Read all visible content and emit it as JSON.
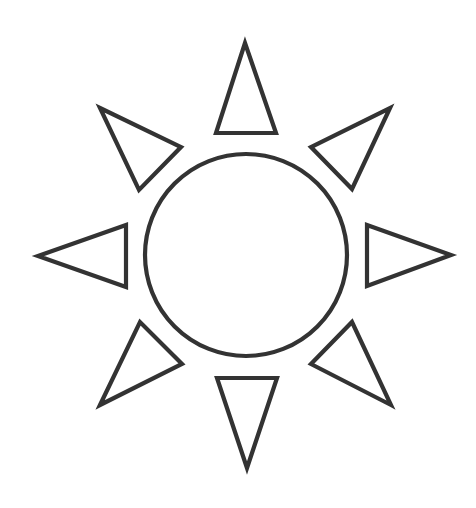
{
  "image": {
    "width": 476,
    "height": 508,
    "background": "#ffffff",
    "description": "Sun outline icon"
  },
  "sun": {
    "stroke_color": "#333333",
    "fill_color": "#ffffff",
    "core": {
      "cx": 246,
      "cy": 255,
      "r": 101
    },
    "rays": [
      {
        "name": "ray-top",
        "points": "245,43 276,133 216,133"
      },
      {
        "name": "ray-top-right",
        "points": "390,108 352,189 311,147"
      },
      {
        "name": "ray-right",
        "points": "451,255 367,286 367,225"
      },
      {
        "name": "ray-bottom-right",
        "points": "391,405 311,364 352,322"
      },
      {
        "name": "ray-bottom",
        "points": "247,468 217,378 277,378"
      },
      {
        "name": "ray-bottom-left",
        "points": "100,405 140,322 182,364"
      },
      {
        "name": "ray-left",
        "points": "38,256 126,225 126,287"
      },
      {
        "name": "ray-top-left",
        "points": "100,108 181,147 139,190"
      }
    ]
  }
}
